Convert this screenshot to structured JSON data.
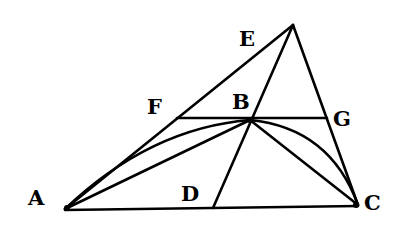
{
  "figure": {
    "type": "geometric-construction",
    "points": {
      "A": {
        "label": "A",
        "x": 65,
        "y": 209
      },
      "B": {
        "label": "B",
        "x": 250,
        "y": 120
      },
      "C": {
        "label": "C",
        "x": 358,
        "y": 205
      },
      "D": {
        "label": "D",
        "x": 213,
        "y": 208
      },
      "E": {
        "label": "E",
        "x": 293,
        "y": 25
      },
      "F": {
        "label": "F",
        "x": 177,
        "y": 118
      },
      "G": {
        "label": "G",
        "x": 327,
        "y": 118
      }
    },
    "segments": [
      "AE",
      "EC",
      "AC",
      "FG",
      "ED",
      "AB",
      "BC"
    ],
    "arcs": [
      "AB",
      "BC"
    ],
    "labels": {
      "A": "A",
      "B": "B",
      "C": "C",
      "D": "D",
      "E": "E",
      "F": "F",
      "G": "G"
    }
  }
}
